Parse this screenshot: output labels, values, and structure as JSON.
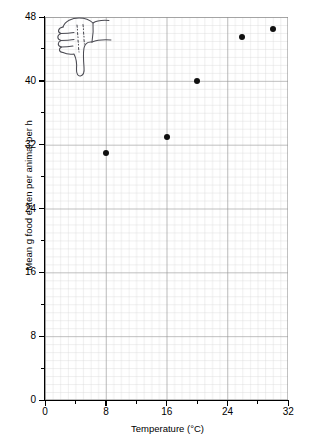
{
  "chart_data": {
    "type": "scatter",
    "title": "",
    "xlabel": "Temperature (°C)",
    "ylabel": "Mean g food eaten per animal per h",
    "xlim": [
      0,
      32
    ],
    "ylim": [
      0,
      48
    ],
    "xticks": [
      "0",
      "8",
      "16",
      "24",
      "32"
    ],
    "xtick_values": [
      0,
      8,
      16,
      24,
      32
    ],
    "yticks": [
      "0",
      "8",
      "16",
      "24",
      "32",
      "40",
      "48"
    ],
    "ytick_values": [
      0,
      8,
      16,
      24,
      32,
      40,
      48
    ],
    "grid": true,
    "grid_minor": true,
    "legend": "none",
    "x": [
      8,
      16,
      20,
      26,
      30
    ],
    "y": [
      31,
      33,
      40,
      45.5,
      46.5
    ],
    "points": [
      {
        "x": 8,
        "y": 31
      },
      {
        "x": 16,
        "y": 33
      },
      {
        "x": 20,
        "y": 40
      },
      {
        "x": 26,
        "y": 45.5
      },
      {
        "x": 30,
        "y": 46.5
      }
    ],
    "annotations": [
      {
        "name": "thumbs-down-doodle",
        "description": "hand drawn thumbs-down symbol overlaying upper-left of plot"
      }
    ]
  },
  "axes": {
    "x_title": "Temperature (°C)",
    "y_title": "Mean g food eaten per animal per h"
  },
  "colors": {
    "point": "#101010",
    "axis": "#000000",
    "grid_major": "#8c8c8c",
    "grid_minor": "#cfcfcf",
    "background": "#ffffff"
  }
}
